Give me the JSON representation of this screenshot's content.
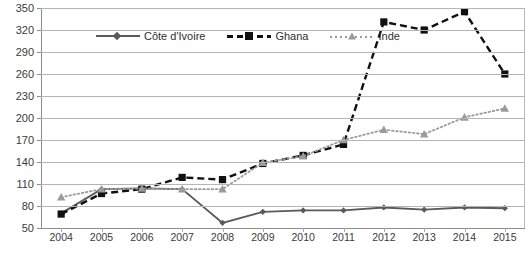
{
  "chart_data": {
    "type": "line",
    "title": "",
    "subtitle": "",
    "xlabel": "",
    "ylabel": "",
    "categories": [
      "2004",
      "2005",
      "2006",
      "2007",
      "2008",
      "2009",
      "2010",
      "2011",
      "2012",
      "2013",
      "2014",
      "2015"
    ],
    "x": [
      2004,
      2005,
      2006,
      2007,
      2008,
      2009,
      2010,
      2011,
      2012,
      2013,
      2014,
      2015
    ],
    "ylim": [
      50,
      350
    ],
    "yticks": [
      50,
      80,
      110,
      140,
      170,
      200,
      230,
      260,
      290,
      320,
      350
    ],
    "ytick_labels": [
      "50",
      "80",
      "110",
      "140",
      "170",
      "200",
      "230",
      "260",
      "290",
      "320",
      "350"
    ],
    "grid": true,
    "legend_position": "top-center",
    "series": [
      {
        "name": "Côte d'Ivoire",
        "color": "#5a5a5a",
        "line_style": "solid",
        "marker": "diamond",
        "values": [
          70,
          103,
          104,
          103,
          57,
          72,
          74,
          74,
          78,
          75,
          78,
          77
        ]
      },
      {
        "name": "Ghana",
        "color": "#111111",
        "line_style": "dashed",
        "marker": "square",
        "values": [
          69,
          97,
          103,
          119,
          116,
          138,
          149,
          164,
          331,
          320,
          345,
          260
        ]
      },
      {
        "name": "Inde",
        "color": "#9a9a9a",
        "line_style": "dotted",
        "marker": "triangle",
        "values": [
          92,
          103,
          104,
          103,
          103,
          139,
          148,
          170,
          184,
          178,
          201,
          213
        ]
      }
    ]
  },
  "legend": {
    "items": [
      {
        "label": "Côte d'Ivoire"
      },
      {
        "label": "Ghana"
      },
      {
        "label": "Inde"
      }
    ]
  }
}
